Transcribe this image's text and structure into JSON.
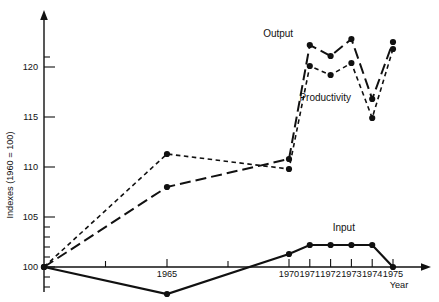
{
  "chart_data": {
    "type": "line",
    "title": "",
    "xlabel": "Year",
    "ylabel": "Indexes (1960 = 100)",
    "x": [
      1960,
      1965,
      1970,
      1971,
      1972,
      1973,
      1974,
      1975
    ],
    "xticklabels": [
      "1965",
      "1970",
      "1971",
      "1972",
      "1973",
      "1974",
      "1975"
    ],
    "xtickvalues": [
      1965,
      1970,
      1971,
      1972,
      1973,
      1974,
      1975
    ],
    "yticklabels": [
      "100",
      "105",
      "110",
      "115",
      "120"
    ],
    "ytickvalues": [
      100,
      105,
      110,
      115,
      120
    ],
    "ylim": [
      96,
      124
    ],
    "xlim": [
      1960,
      1975.6
    ],
    "grid": false,
    "legend_position": "inline-annotations",
    "series": [
      {
        "name": "Output",
        "style": "long-dashed",
        "marker": "filled-circle",
        "values": [
          100,
          108.0,
          110.8,
          122.2,
          121.1,
          122.8,
          116.8,
          122.5
        ],
        "label_x": 1970.2,
        "label_y": 123.0
      },
      {
        "name": "Productivity",
        "style": "short-dashed",
        "marker": "filled-circle",
        "values": [
          100,
          111.3,
          109.8,
          120.1,
          119.2,
          120.4,
          114.9,
          121.8
        ],
        "label_x": 1970.5,
        "label_y": 116.6
      },
      {
        "name": "Input",
        "style": "solid",
        "marker": "filled-circle",
        "values": [
          100,
          97.3,
          101.3,
          102.2,
          102.2,
          102.2,
          102.2,
          100.0
        ],
        "label_x": 1972.1,
        "label_y": 103.6
      }
    ],
    "annotations": [
      {
        "text": "Output",
        "name": "output-series-label"
      },
      {
        "text": "Productivity",
        "name": "productivity-series-label"
      },
      {
        "text": "Input",
        "name": "input-series-label"
      }
    ]
  },
  "axes": {
    "y_title": "Indexes (1960 = 100)",
    "x_title": "Year"
  }
}
